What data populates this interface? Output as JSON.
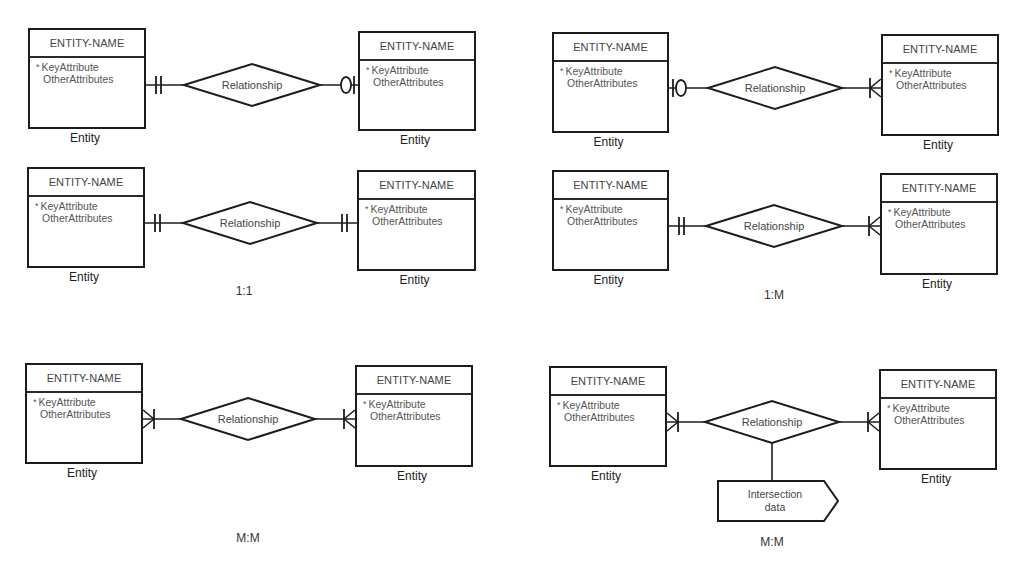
{
  "diagram": {
    "stroke_color": "#1c1c1c",
    "text_color": "#444444",
    "background": "#ffffff",
    "entity_template": {
      "name": "ENTITY-NAME",
      "key_marker": "*",
      "key_attribute": "KeyAttribute",
      "other_attributes": "OtherAttributes",
      "caption": "Entity"
    },
    "relationship_label": "Relationship",
    "panels": [
      {
        "id": "one-to-one-optional",
        "cardinality_label": "",
        "left_entity": {
          "name": "ENTITY-NAME",
          "key_attribute": "KeyAttribute",
          "other_attributes": "OtherAttributes",
          "caption": "Entity",
          "box": [
            28,
            28,
            118,
            101
          ]
        },
        "right_entity": {
          "name": "ENTITY-NAME",
          "key_attribute": "KeyAttribute",
          "other_attributes": "OtherAttributes",
          "caption": "Entity",
          "box": [
            358,
            31,
            118,
            100
          ]
        },
        "relationship": {
          "label": "Relationship",
          "cx": 252,
          "cy": 85,
          "hw": 68,
          "hh": 21
        },
        "left_end": "one-mandatory",
        "right_end": "zero-or-one"
      },
      {
        "id": "one-to-one",
        "cardinality_label": "1:1",
        "cardinality_pos": [
          244,
          284
        ],
        "left_entity": {
          "name": "ENTITY-NAME",
          "key_attribute": "KeyAttribute",
          "other_attributes": "OtherAttributes",
          "caption": "Entity",
          "box": [
            27,
            167,
            118,
            101
          ]
        },
        "right_entity": {
          "name": "ENTITY-NAME",
          "key_attribute": "KeyAttribute",
          "other_attributes": "OtherAttributes",
          "caption": "Entity",
          "box": [
            357,
            170,
            119,
            101
          ]
        },
        "relationship": {
          "label": "Relationship",
          "cx": 250,
          "cy": 223,
          "hw": 67,
          "hh": 21
        },
        "left_end": "one-mandatory",
        "right_end": "one-mandatory"
      },
      {
        "id": "one-to-many-optional",
        "cardinality_label": "",
        "left_entity": {
          "name": "ENTITY-NAME",
          "key_attribute": "KeyAttribute",
          "other_attributes": "OtherAttributes",
          "caption": "Entity",
          "box": [
            552,
            32,
            117,
            101
          ]
        },
        "right_entity": {
          "name": "ENTITY-NAME",
          "key_attribute": "KeyAttribute",
          "other_attributes": "OtherAttributes",
          "caption": "Entity",
          "box": [
            881,
            34,
            118,
            102
          ]
        },
        "relationship": {
          "label": "Relationship",
          "cx": 775,
          "cy": 88,
          "hw": 67,
          "hh": 21
        },
        "left_end": "zero-or-one",
        "right_end": "one-or-many"
      },
      {
        "id": "one-to-many",
        "cardinality_label": "1:M",
        "cardinality_pos": [
          774,
          288
        ],
        "left_entity": {
          "name": "ENTITY-NAME",
          "key_attribute": "KeyAttribute",
          "other_attributes": "OtherAttributes",
          "caption": "Entity",
          "box": [
            552,
            170,
            117,
            101
          ]
        },
        "right_entity": {
          "name": "ENTITY-NAME",
          "key_attribute": "KeyAttribute",
          "other_attributes": "OtherAttributes",
          "caption": "Entity",
          "box": [
            880,
            173,
            118,
            102
          ]
        },
        "relationship": {
          "label": "Relationship",
          "cx": 774,
          "cy": 226,
          "hw": 68,
          "hh": 21
        },
        "left_end": "one-mandatory",
        "right_end": "one-or-many"
      },
      {
        "id": "many-to-many",
        "cardinality_label": "M:M",
        "cardinality_pos": [
          248,
          531
        ],
        "left_entity": {
          "name": "ENTITY-NAME",
          "key_attribute": "KeyAttribute",
          "other_attributes": "OtherAttributes",
          "caption": "Entity",
          "box": [
            25,
            363,
            118,
            101
          ]
        },
        "right_entity": {
          "name": "ENTITY-NAME",
          "key_attribute": "KeyAttribute",
          "other_attributes": "OtherAttributes",
          "caption": "Entity",
          "box": [
            355,
            365,
            118,
            102
          ]
        },
        "relationship": {
          "label": "Relationship",
          "cx": 248,
          "cy": 419,
          "hw": 67,
          "hh": 21
        },
        "left_end": "one-or-many",
        "right_end": "one-or-many"
      },
      {
        "id": "many-to-many-intersection",
        "cardinality_label": "M:M",
        "cardinality_pos": [
          772,
          535
        ],
        "left_entity": {
          "name": "ENTITY-NAME",
          "key_attribute": "KeyAttribute",
          "other_attributes": "OtherAttributes",
          "caption": "Entity",
          "box": [
            549,
            366,
            118,
            101
          ]
        },
        "right_entity": {
          "name": "ENTITY-NAME",
          "key_attribute": "KeyAttribute",
          "other_attributes": "OtherAttributes",
          "caption": "Entity",
          "box": [
            879,
            369,
            118,
            101
          ]
        },
        "relationship": {
          "label": "Relationship",
          "cx": 772,
          "cy": 422,
          "hw": 67,
          "hh": 21
        },
        "left_end": "one-or-many",
        "right_end": "one-or-many",
        "intersection": {
          "line1": "Intersection",
          "line2": "data",
          "box": [
            718,
            481,
            106,
            40
          ],
          "tip": 14
        }
      }
    ]
  }
}
